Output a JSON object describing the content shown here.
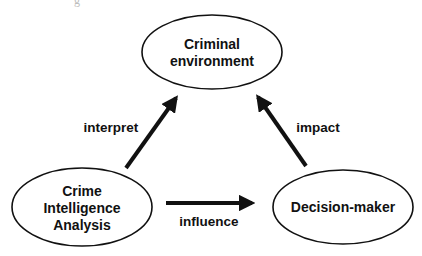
{
  "caption_fragment": "g",
  "nodes": [
    {
      "id": "criminal-environment",
      "lines": [
        "Criminal",
        "environment"
      ]
    },
    {
      "id": "crime-intelligence-analysis",
      "lines": [
        "Crime",
        "Intelligence",
        "Analysis"
      ]
    },
    {
      "id": "decision-maker",
      "lines": [
        "Decision-maker"
      ]
    }
  ],
  "edges": [
    {
      "from": "crime-intelligence-analysis",
      "to": "criminal-environment",
      "label": "interpret"
    },
    {
      "from": "decision-maker",
      "to": "criminal-environment",
      "label": "impact"
    },
    {
      "from": "crime-intelligence-analysis",
      "to": "decision-maker",
      "label": "influence"
    }
  ],
  "colors": {
    "stroke": "#111111",
    "background": "#ffffff"
  }
}
